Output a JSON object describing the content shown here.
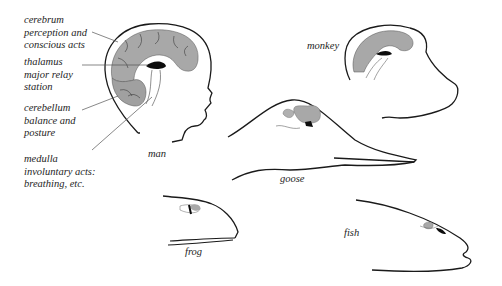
{
  "figure": {
    "colors": {
      "outline": "#1a1a1a",
      "brain_fill": "#a8a8a8",
      "thalamus_fill": "#0d0d0d",
      "leader_line": "#555555"
    },
    "structure_labels": [
      {
        "name": "cerebrum",
        "lines": [
          "cerebrum",
          "perception and",
          "conscious acts"
        ]
      },
      {
        "name": "thalamus",
        "lines": [
          "thalamus",
          "major relay",
          "station"
        ]
      },
      {
        "name": "cerebellum",
        "lines": [
          "cerebellum",
          "balance and",
          "posture"
        ]
      },
      {
        "name": "medulla",
        "lines": [
          "medulla",
          "involuntary acts:",
          "breathing, etc."
        ]
      }
    ],
    "species": {
      "man": "man",
      "monkey": "monkey",
      "goose": "goose",
      "frog": "frog",
      "fish": "fish"
    }
  }
}
